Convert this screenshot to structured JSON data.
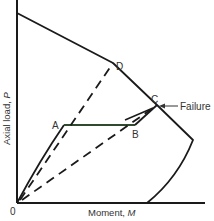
{
  "diagram": {
    "title": "",
    "axes": {
      "x_label": "Moment, M",
      "x_label_text": "Moment, ",
      "x_label_var": "M",
      "y_label_text": "Axial load, ",
      "y_label_var": "P",
      "origin_label": "0"
    },
    "points": {
      "A": "A",
      "B": "B",
      "C": "C",
      "D": "D"
    },
    "annotations": {
      "failure": "Failure"
    },
    "colors": {
      "line": "#1a1a1a",
      "ab_line": "#2f4a2f",
      "text": "#333333",
      "background": "#ffffff"
    }
  }
}
